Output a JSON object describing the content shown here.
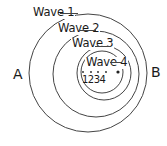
{
  "diagram": {
    "waves": [
      {
        "label": "Wave 1",
        "cx": 88,
        "cy": 73,
        "r": 59
      },
      {
        "label": "Wave 2",
        "cx": 96,
        "cy": 74,
        "r": 43
      },
      {
        "label": "Wave 3",
        "cx": 104,
        "cy": 73,
        "r": 27
      },
      {
        "label": "Wave 4",
        "cx": 102,
        "cy": 72,
        "r": 21
      }
    ],
    "source_positions": [
      {
        "label": "1",
        "x": 83,
        "y": 72
      },
      {
        "label": "2",
        "x": 91,
        "y": 72
      },
      {
        "label": "3",
        "x": 98,
        "y": 72
      },
      {
        "label": "4",
        "x": 106,
        "y": 72
      }
    ],
    "current_source": {
      "x": 118,
      "y": 72
    },
    "positions_label": "1234",
    "observer_left": "A",
    "observer_right": "B",
    "line_color": "#444444",
    "text_color": "#1a1a1a"
  }
}
